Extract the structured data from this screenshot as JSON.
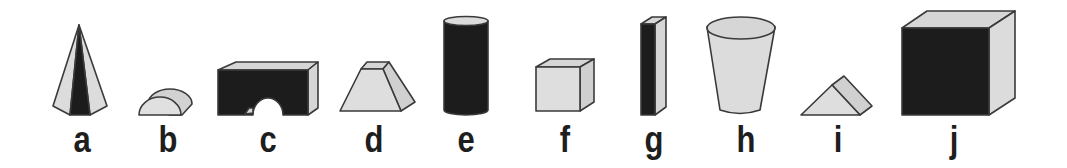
{
  "colors": {
    "light": "#dcdcdc",
    "mid": "#c9c9c9",
    "dark": "#1c1c1c",
    "stroke": "#3a3a3a",
    "label": "#1e1e1e"
  },
  "figures": [
    {
      "id": "a",
      "label": "a",
      "shape": "hexagonal-pyramid",
      "label_x": 82
    },
    {
      "id": "b",
      "label": "b",
      "shape": "half-cylinder",
      "label_x": 168
    },
    {
      "id": "c",
      "label": "c",
      "shape": "arch-bridge-block",
      "label_x": 268
    },
    {
      "id": "d",
      "label": "d",
      "shape": "truncated-pyramid",
      "label_x": 374
    },
    {
      "id": "e",
      "label": "e",
      "shape": "cylinder",
      "label_x": 466
    },
    {
      "id": "f",
      "label": "f",
      "shape": "cube",
      "label_x": 565
    },
    {
      "id": "g",
      "label": "g",
      "shape": "rectangular-bar",
      "label_x": 654
    },
    {
      "id": "h",
      "label": "h",
      "shape": "truncated-cone-cup",
      "label_x": 746
    },
    {
      "id": "i",
      "label": "i",
      "shape": "triangular-prism",
      "label_x": 838
    },
    {
      "id": "j",
      "label": "j",
      "shape": "large-cube",
      "label_x": 954
    }
  ]
}
